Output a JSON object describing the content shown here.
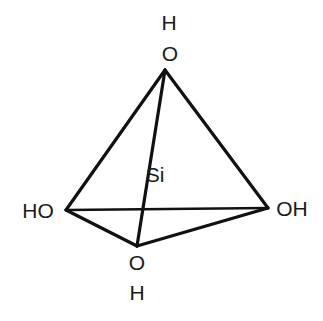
{
  "diagram": {
    "center_atom": "Si",
    "labels": {
      "top_h": "H",
      "top_o": "O",
      "center": "Si",
      "left": "HO",
      "right": "OH",
      "bottom_o": "O",
      "bottom_h": "H"
    },
    "vertices": {
      "top": [
        165,
        70
      ],
      "left": [
        66,
        210
      ],
      "right": [
        268,
        208
      ],
      "bottom": [
        137,
        246
      ]
    },
    "edges": [
      [
        "top",
        "left"
      ],
      [
        "top",
        "right"
      ],
      [
        "top",
        "bottom"
      ],
      [
        "left",
        "right"
      ],
      [
        "left",
        "bottom"
      ],
      [
        "bottom",
        "right"
      ]
    ],
    "colors": {
      "line": "#111111",
      "text": "#1a1a1a",
      "background": "#ffffff"
    }
  }
}
